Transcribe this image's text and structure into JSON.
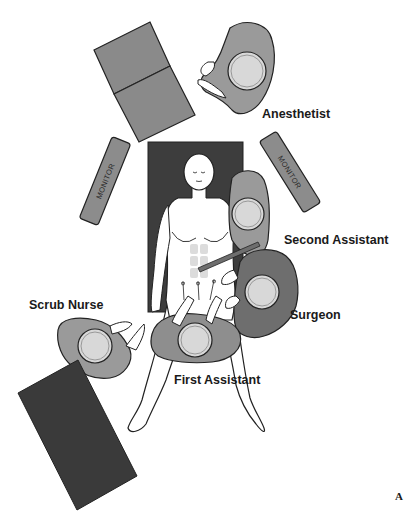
{
  "figure": {
    "panel_label": "A"
  },
  "roles": {
    "anesthetist": "Anesthetist",
    "second_assistant": "Second Assistant",
    "surgeon": "Surgeon",
    "scrub_nurse": "Scrub Nurse",
    "first_assistant": "First Assistant"
  },
  "equipment": {
    "monitor_left": "MONITOR",
    "monitor_right": "MONITOR"
  },
  "colors": {
    "table": "#3d3d3d",
    "instrument_table": "#3a3a3a",
    "anesthesia_machine": "#8a8a8a",
    "monitor": "#8c8c8c",
    "gown_light": "#9a9a9a",
    "gown_dark": "#6e6e6e",
    "head": "#d8d8d8",
    "skin": "#ffffff"
  }
}
